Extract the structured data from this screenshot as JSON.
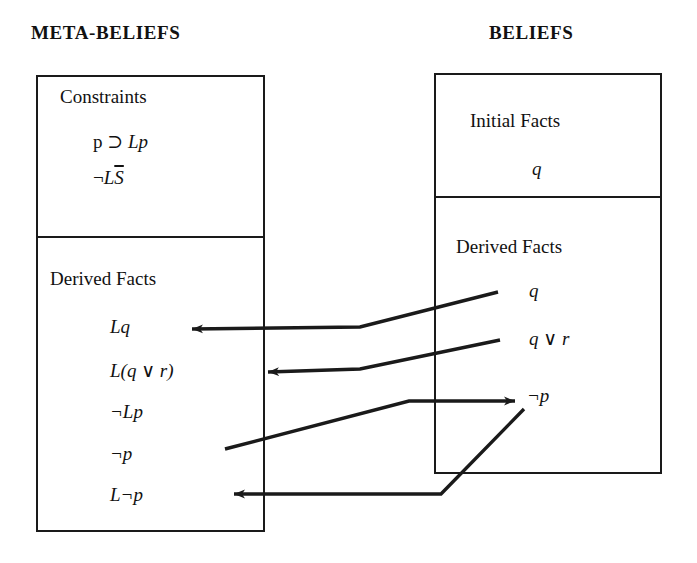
{
  "columns": {
    "left_title": "META-BELIEFS",
    "right_title": "BELIEFS"
  },
  "meta_beliefs_panel": {
    "constraints": {
      "heading": "Constraints",
      "items": [
        {
          "text": "p ⊃ Lp"
        },
        {
          "text": "¬L S̅"
        }
      ]
    },
    "derived_facts": {
      "heading": "Derived Facts",
      "items": [
        {
          "text": "Lq"
        },
        {
          "text": "L(q ∨ r)"
        },
        {
          "text": "¬Lp"
        },
        {
          "text": "¬p"
        },
        {
          "text": "L¬p"
        }
      ]
    }
  },
  "beliefs_panel": {
    "initial_facts": {
      "heading": "Initial Facts",
      "items": [
        {
          "text": "q"
        }
      ]
    },
    "derived_facts": {
      "heading": "Derived Facts",
      "items": [
        {
          "text": "q"
        },
        {
          "text": "q ∨ r"
        },
        {
          "text": "¬p"
        }
      ]
    }
  },
  "arrows": [
    {
      "name": "arrow-q-to-Lq",
      "direction": "right-to-left",
      "from": "beliefs.derived_facts.q",
      "to": "meta_beliefs.derived_facts.Lq"
    },
    {
      "name": "arrow-qvr-to-Lqvr",
      "direction": "right-to-left",
      "from": "beliefs.derived_facts.q_or_r",
      "to": "meta_beliefs.derived_facts.L_q_or_r"
    },
    {
      "name": "arrow-notp-to-beliefs-notp",
      "direction": "left-to-right",
      "from": "meta_beliefs.derived_facts.not_p",
      "to": "beliefs.derived_facts.not_p"
    },
    {
      "name": "arrow-beliefs-notp-to-Lnotp",
      "direction": "right-to-left",
      "from": "beliefs.derived_facts.not_p",
      "to": "meta_beliefs.derived_facts.L_not_p"
    }
  ],
  "style": {
    "ink": "#1a1a1a",
    "paper": "#ffffff"
  }
}
